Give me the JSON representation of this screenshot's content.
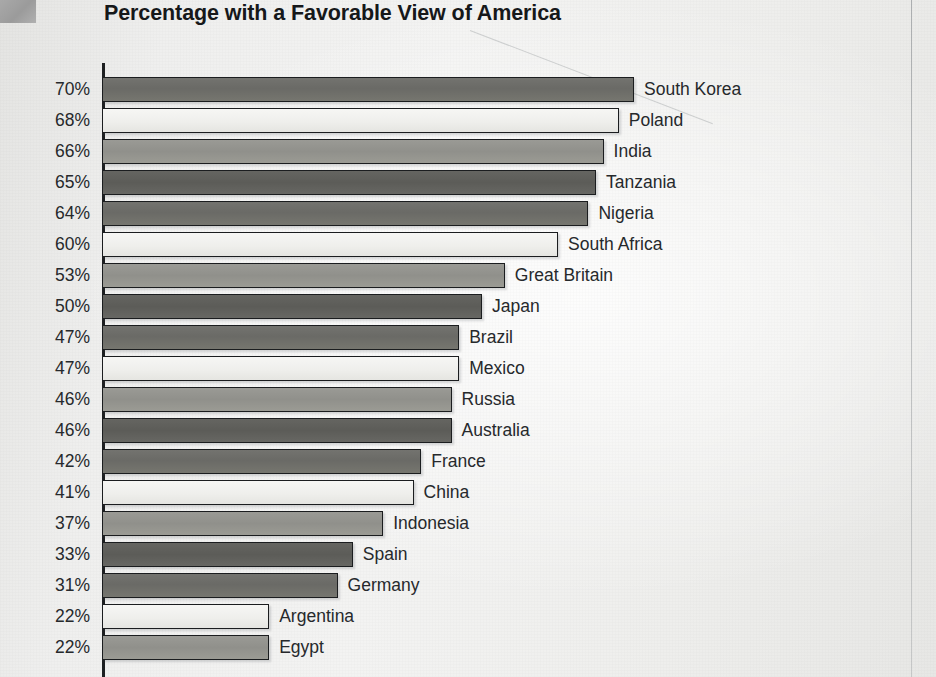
{
  "title": "Percentage with a Favorable View of America",
  "corner_block": {
    "name": "grey-marker-block",
    "color": "#a3a3a3"
  },
  "chart_data": {
    "type": "bar",
    "orientation": "horizontal",
    "title": "Percentage with a Favorable View of America",
    "xlabel": "",
    "ylabel": "",
    "value_suffix": "%",
    "xlim": [
      0,
      72
    ],
    "grid": false,
    "legend": null,
    "axis_line": true,
    "note": "Bars are sorted descending; value labels sit at the left as y-axis tick labels and country names sit at the end of each bar.",
    "bar_shade_cycle": [
      "#6f6f6b",
      "#efefec",
      "#93938e",
      "#5f5f5b"
    ],
    "categories": [
      "South Korea",
      "Poland",
      "India",
      "Tanzania",
      "Nigeria",
      "South Africa",
      "Great Britain",
      "Japan",
      "Brazil",
      "Mexico",
      "Russia",
      "Australia",
      "France",
      "China",
      "Indonesia",
      "Spain",
      "Germany",
      "Argentina",
      "Egypt"
    ],
    "values": [
      70,
      68,
      66,
      65,
      64,
      60,
      53,
      50,
      47,
      47,
      46,
      46,
      42,
      41,
      37,
      33,
      31,
      22,
      22
    ],
    "tick_labels": [
      "70%",
      "68%",
      "66%",
      "65%",
      "64%",
      "60%",
      "53%",
      "50%",
      "47%",
      "47%",
      "46%",
      "46%",
      "42%",
      "41%",
      "37%",
      "33%",
      "31%",
      "22%",
      "22%"
    ],
    "rows": [
      {
        "label": "70%",
        "value": 70,
        "country": "South Korea"
      },
      {
        "label": "68%",
        "value": 68,
        "country": "Poland"
      },
      {
        "label": "66%",
        "value": 66,
        "country": "India"
      },
      {
        "label": "65%",
        "value": 65,
        "country": "Tanzania"
      },
      {
        "label": "64%",
        "value": 64,
        "country": "Nigeria"
      },
      {
        "label": "60%",
        "value": 60,
        "country": "South Africa"
      },
      {
        "label": "53%",
        "value": 53,
        "country": "Great Britain"
      },
      {
        "label": "50%",
        "value": 50,
        "country": "Japan"
      },
      {
        "label": "47%",
        "value": 47,
        "country": "Brazil"
      },
      {
        "label": "47%",
        "value": 47,
        "country": "Mexico"
      },
      {
        "label": "46%",
        "value": 46,
        "country": "Russia"
      },
      {
        "label": "46%",
        "value": 46,
        "country": "Australia"
      },
      {
        "label": "42%",
        "value": 42,
        "country": "France"
      },
      {
        "label": "41%",
        "value": 41,
        "country": "China"
      },
      {
        "label": "37%",
        "value": 37,
        "country": "Indonesia"
      },
      {
        "label": "33%",
        "value": 33,
        "country": "Spain"
      },
      {
        "label": "31%",
        "value": 31,
        "country": "Germany"
      },
      {
        "label": "22%",
        "value": 22,
        "country": "Argentina"
      },
      {
        "label": "22%",
        "value": 22,
        "country": "Egypt"
      }
    ]
  }
}
